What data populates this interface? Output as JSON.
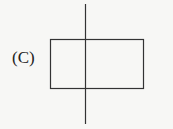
{
  "figure": {
    "label": "(C)",
    "shapes": [
      {
        "type": "rectangle",
        "x": 50.5,
        "y": 39.5,
        "width": 93,
        "height": 49
      },
      {
        "type": "vertical-line",
        "x": 85.5,
        "y1": 4,
        "y2": 124
      }
    ],
    "stroke_color": "#333333"
  }
}
